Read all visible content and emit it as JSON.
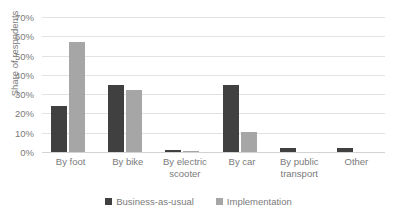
{
  "chart_data": {
    "type": "bar",
    "title": "",
    "subtitle": "",
    "xlabel": "",
    "ylabel": "Share of respndents",
    "ylim": [
      0,
      70
    ],
    "ytick_labels": [
      "70%",
      "60%",
      "50%",
      "40%",
      "30%",
      "20%",
      "10%",
      "0%"
    ],
    "ytick_values": [
      70,
      60,
      50,
      40,
      30,
      20,
      10,
      0
    ],
    "grid": true,
    "legend_position": "bottom",
    "categories": [
      "By foot",
      "By bike",
      "By electric scooter",
      "By car",
      "By public transport",
      "Other"
    ],
    "series": [
      {
        "name": "Business-as-usual",
        "color": "#404040",
        "values": [
          24,
          35,
          1,
          35,
          2,
          2
        ]
      },
      {
        "name": "Implementation",
        "color": "#a6a6a6",
        "values": [
          57,
          32,
          0.5,
          10.5,
          0,
          0
        ]
      }
    ]
  },
  "legend": {
    "items": [
      {
        "label": "Business-as-usual",
        "color": "#404040"
      },
      {
        "label": "Implementation",
        "color": "#a6a6a6"
      }
    ]
  },
  "colors": {
    "series_dark": "#404040",
    "series_light": "#a6a6a6",
    "gridline": "#e2e2e2",
    "text": "#7a7a7a",
    "background": "#ffffff"
  }
}
